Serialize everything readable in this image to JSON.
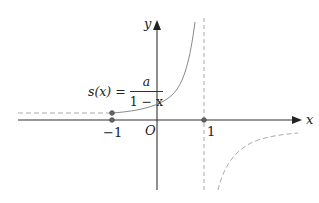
{
  "diagram": {
    "type": "function-graph",
    "axes": {
      "x_label": "x",
      "y_label": "y",
      "origin_label": "O"
    },
    "ticks": {
      "neg_one": "−1",
      "one": "1"
    },
    "function_label": {
      "lhs": "s(x) =",
      "numerator": "a",
      "denominator": "1 − x"
    },
    "elements": [
      "solid curve s(x)=a/(1-x) for -1 ≤ x < 1",
      "dashed extension for x < -1",
      "dashed vertical asymptote at x = 1",
      "dashed branch for x > 1 (below x-axis)",
      "open point at (-1, s(-1))",
      "open point at (-1, 0)",
      "open point at (1, 0)"
    ],
    "colors": {
      "axis": "#222222",
      "curve": "#888888",
      "dashed": "#aaaaaa"
    }
  }
}
